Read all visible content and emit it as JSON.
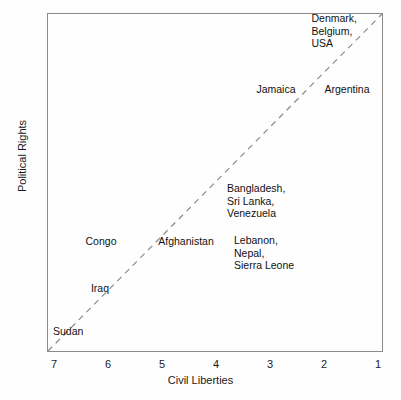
{
  "chart_data": {
    "type": "scatter",
    "title": "",
    "subtitle": "",
    "xlabel": "Civil Liberties",
    "ylabel": "Political Rights",
    "xlim": [
      7.5,
      0.7
    ],
    "ylim": [
      7.5,
      0.65
    ],
    "x_ticks": [
      7,
      6,
      5,
      4,
      3,
      2,
      1
    ],
    "y_ticks": [
      1,
      2,
      3,
      4,
      5,
      6,
      7
    ],
    "x_tick_labels": [
      "7",
      "6",
      "5",
      "4",
      "3",
      "2",
      "1"
    ],
    "y_tick_labels": [
      "1",
      "2",
      "3",
      "4",
      "5",
      "6",
      "7"
    ],
    "x_axis_reversed": true,
    "y_axis_reversed": true,
    "grid": false,
    "legend": "none",
    "marker_style": "text-label-only",
    "annotations": [
      {
        "label": "Denmark,\nBelgium,\nUSA",
        "countries": [
          "Denmark",
          "Belgium",
          "USA"
        ],
        "civil_liberties": 1,
        "political_rights": 1,
        "anchor": "right",
        "px": 356,
        "py": 30
      },
      {
        "label": "Jamaica",
        "countries": [
          "Jamaica"
        ],
        "civil_liberties": 3.65,
        "political_rights": 2,
        "anchor": "center",
        "px": 275,
        "py": 88
      },
      {
        "label": "Argentina",
        "countries": [
          "Argentina"
        ],
        "civil_liberties": 2.2,
        "political_rights": 2,
        "anchor": "center",
        "px": 346,
        "py": 88
      },
      {
        "label": "Bangladesh,\nSri Lanka,\nVenezuela",
        "countries": [
          "Bangladesh",
          "Sri Lanka",
          "Venezuela"
        ],
        "civil_liberties": 3.85,
        "political_rights": 4,
        "anchor": "left",
        "px": 226,
        "py": 200
      },
      {
        "label": "Congo",
        "countries": [
          "Congo"
        ],
        "civil_liberties": 6.3,
        "political_rights": 5,
        "anchor": "center",
        "px": 100,
        "py": 240
      },
      {
        "label": "Afghanistan",
        "countries": [
          "Afghanistan"
        ],
        "civil_liberties": 5.15,
        "political_rights": 5,
        "anchor": "center",
        "px": 185,
        "py": 240
      },
      {
        "label": "Lebanon,\nNepal,\nSierra Leone",
        "countries": [
          "Lebanon",
          "Nepal",
          "Sierra Leone"
        ],
        "civil_liberties": 4.05,
        "political_rights": 5,
        "anchor": "left",
        "px": 233,
        "py": 252
      },
      {
        "label": "Iraq",
        "countries": [
          "Iraq"
        ],
        "civil_liberties": 6.1,
        "political_rights": 6,
        "anchor": "center",
        "px": 99,
        "py": 287
      },
      {
        "label": "Sudan",
        "countries": [
          "Sudan"
        ],
        "civil_liberties": 7,
        "political_rights": 7,
        "anchor": "left",
        "px": 52,
        "py": 330
      }
    ],
    "reference_line": {
      "name": "identity-line",
      "style": "dashed",
      "color": "#8a8a8a",
      "from": [
        7.5,
        7.5
      ],
      "to": [
        0.7,
        0.65
      ],
      "description": "45-degree dashed diagonal from bottom-left to top-right corner"
    },
    "colors": {
      "frame": "#8a8a8a",
      "text": "#111111",
      "dashed_line": "#8a8a8a",
      "background": "#fefefe"
    }
  }
}
